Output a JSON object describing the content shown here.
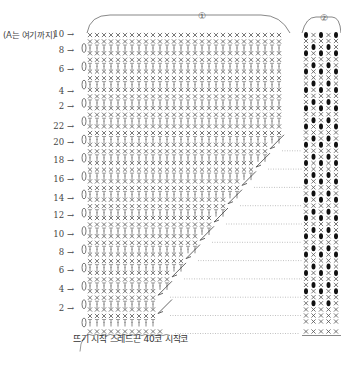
{
  "note_label": "(A는 여기까지)",
  "caption": "뜨기 시작 스레드끈 40코 시작코",
  "section_labels": {
    "main": "①",
    "pattern": "②"
  },
  "row_labels": [
    {
      "label": "10",
      "y": 35,
      "type": "arrow-ch"
    },
    {
      "label": "8",
      "y": 51,
      "type": "arrow-turn"
    },
    {
      "label": "6",
      "y": 70,
      "type": "arrow-ch"
    },
    {
      "label": "4",
      "y": 92,
      "type": "arrow-turn"
    },
    {
      "label": "2",
      "y": 107,
      "type": "arrow-ch"
    },
    {
      "label": "22",
      "y": 127,
      "type": "arrow-turn"
    },
    {
      "label": "20",
      "y": 143,
      "type": "arrow-ch"
    },
    {
      "label": "18",
      "y": 161,
      "type": "arrow-turn"
    },
    {
      "label": "16",
      "y": 180,
      "type": "arrow-ch"
    },
    {
      "label": "14",
      "y": 199,
      "type": "arrow-turn"
    },
    {
      "label": "12",
      "y": 216,
      "type": "arrow-ch"
    },
    {
      "label": "10",
      "y": 235,
      "type": "arrow-turn"
    },
    {
      "label": "8",
      "y": 253,
      "type": "arrow-ch"
    },
    {
      "label": "6",
      "y": 271,
      "type": "arrow-turn"
    },
    {
      "label": "4",
      "y": 290,
      "type": "arrow-ch"
    },
    {
      "label": "2",
      "y": 309,
      "type": "arrow-turn"
    }
  ],
  "chart_data": {
    "type": "table",
    "stitch_symbols": {
      "x": "single crochet",
      "T": "double crochet",
      "●": "bobble / popcorn",
      "~": "chain"
    },
    "foundation": "40 chain start",
    "main_section": "①",
    "pattern_section": "②",
    "main_columns": 28,
    "pattern_columns": 5,
    "row_numbers_top_block": [
      10,
      8,
      6,
      4,
      2
    ],
    "row_numbers_bottom_block": [
      22,
      20,
      18,
      16,
      14,
      12,
      10,
      8,
      6,
      4,
      2
    ]
  },
  "colors": {
    "ink": "#555555",
    "light_ink": "#888888",
    "bobble": "#111111",
    "dotted": "#999999"
  }
}
